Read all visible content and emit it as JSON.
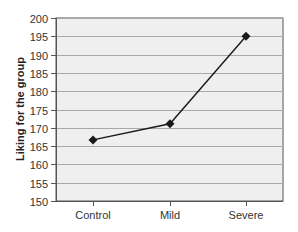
{
  "chart_data": {
    "type": "line",
    "title": "",
    "xlabel": "",
    "ylabel": "Liking for the group",
    "categories": [
      "Control",
      "Mild",
      "Severe"
    ],
    "series": [
      {
        "name": "Liking",
        "values": [
          166.7,
          171.1,
          195.0
        ],
        "marker": "diamond",
        "color": "#1a1a1a"
      }
    ],
    "ylim": [
      150,
      200
    ],
    "yticks": [
      150,
      155,
      160,
      165,
      170,
      175,
      180,
      185,
      190,
      195,
      200
    ],
    "grid": true,
    "legend": null
  },
  "colors": {
    "plot_background": "#efefef",
    "gridline": "#a8a8a8",
    "axis": "#555555",
    "series": "#1a1a1a"
  }
}
